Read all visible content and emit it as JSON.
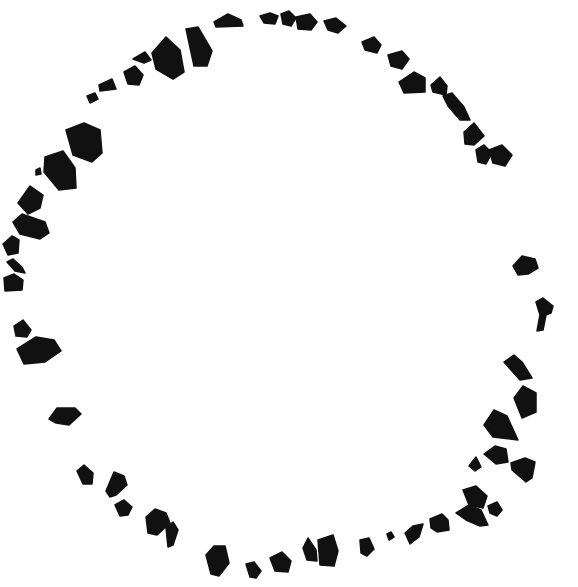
{
  "image": {
    "width": 578,
    "height": 587,
    "background": "#ffffff",
    "fill": "#111111",
    "subject": "irregular black fragments arranged in a broken ring"
  },
  "fragments": [
    {
      "points": "214,22 228,14 241,20 243,26 216,27"
    },
    {
      "points": "260,16 270,13 278,16 275,24 264,23"
    },
    {
      "points": "281,14 289,11 296,18 291,26 283,24"
    },
    {
      "points": "296,17 310,14 317,22 311,30 298,29"
    },
    {
      "points": "324,21 336,18 346,26 338,33 328,30"
    },
    {
      "points": "362,42 374,37 381,45 377,53 365,50"
    },
    {
      "points": "388,55 402,51 409,59 402,69 391,66"
    },
    {
      "points": "399,82 414,72 425,78 425,92 404,93"
    },
    {
      "points": "431,85 440,77 447,86 446,95 433,92"
    },
    {
      "points": "443,96 452,93 464,107 470,120 460,120 448,106"
    },
    {
      "points": "464,132 474,123 484,136 474,145 465,144"
    },
    {
      "points": "476,150 484,145 492,153 486,164 478,162"
    },
    {
      "points": "489,150 502,145 512,155 505,166 493,163"
    },
    {
      "points": "186,29 198,27 212,51 207,66 194,66"
    },
    {
      "points": "152,53 166,37 180,50 184,72 173,79 156,69"
    },
    {
      "points": "133,59 145,52 151,60 144,63"
    },
    {
      "points": "124,72 135,66 143,75 139,85 128,84"
    },
    {
      "points": "99,85 112,79 116,89 100,91"
    },
    {
      "points": "87,96 95,93 98,99 90,103"
    },
    {
      "points": "66,130 84,123 100,130 102,153 92,162 73,155"
    },
    {
      "points": "45,157 63,151 75,168 76,188 59,190 44,172"
    },
    {
      "points": "36,170 40,168 41,174 36,175"
    },
    {
      "points": "18,203 30,186 43,195 40,208 28,214"
    },
    {
      "points": "13,222 22,214 45,222 49,233 40,239 20,234"
    },
    {
      "points": "3,244 12,236 19,240 18,253 8,255"
    },
    {
      "points": "7,262 13,259 22,267 25,273 15,271"
    },
    {
      "points": "4,278 14,274 23,280 22,290 5,291"
    },
    {
      "points": "14,326 23,320 31,330 27,337 16,336"
    },
    {
      "points": "17,349 36,337 54,340 61,351 45,362 24,364"
    },
    {
      "points": "49,419 57,408 75,408 81,414 69,425 56,423"
    },
    {
      "points": "77,471 84,465 93,473 92,484 83,484"
    },
    {
      "points": "106,491 114,472 124,476 127,485 116,495 110,497"
    },
    {
      "points": "115,505 124,500 132,507 128,515 120,516"
    },
    {
      "points": "146,517 155,509 166,513 170,523 157,535 148,533"
    },
    {
      "points": "166,528 173,522 178,530 173,545 168,547"
    },
    {
      "points": "206,555 214,546 225,546 229,563 219,576 211,574"
    },
    {
      "points": "246,564 254,562 261,571 256,578 250,577"
    },
    {
      "points": "270,558 282,552 291,561 288,572 275,571"
    },
    {
      "points": "303,548 308,538 316,550 317,561 307,560"
    },
    {
      "points": "318,540 333,535 338,551 334,566 320,565"
    },
    {
      "points": "360,540 369,538 374,549 367,556 361,553"
    },
    {
      "points": "387,534 391,532 394,537 389,540"
    },
    {
      "points": "405,533 413,526 423,524 419,537 410,544"
    },
    {
      "points": "430,519 442,514 448,520 449,530 437,532 431,528"
    },
    {
      "points": "456,513 469,505 481,510 488,525 480,526 466,520"
    },
    {
      "points": "463,490 476,486 487,496 483,508 469,505"
    },
    {
      "points": "488,506 497,502 502,510 497,516 490,513"
    },
    {
      "points": "469,466 476,457 481,467 475,471"
    },
    {
      "points": "484,454 495,446 506,449 508,462 496,464"
    },
    {
      "points": "511,463 525,458 535,462 532,478 526,482 512,470"
    },
    {
      "points": "484,425 494,410 507,416 518,440 493,437"
    },
    {
      "points": "514,398 523,386 536,393 536,412 522,418"
    },
    {
      "points": "504,362 514,355 522,362 532,378 520,380"
    },
    {
      "points": "536,302 543,298 553,306 551,313 546,315 543,330 537,331 540,315"
    },
    {
      "points": "513,266 522,256 535,259 538,268 528,274 518,275"
    }
  ]
}
